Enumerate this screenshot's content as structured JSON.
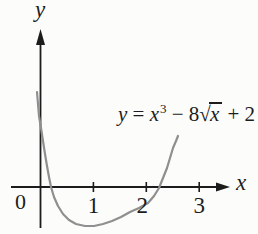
{
  "figure": {
    "background": "#fcfcfb",
    "axis_color": "#1c1c1c",
    "curve_color": "#8f8f8f"
  },
  "labels": {
    "x_axis": "x",
    "y_axis": "y",
    "origin": "0"
  },
  "equation": {
    "lhs": "y",
    "equals": " = ",
    "base": "x",
    "exponent": "3",
    "minus_coef": " − 8",
    "radical": "√",
    "radicand": "x",
    "tail": " + 2"
  },
  "chart_data": {
    "type": "line",
    "equation_text": "y = x³ − 8√x + 2",
    "xlabel": "x",
    "ylabel": "y",
    "x_ticks": [
      1,
      2,
      3
    ],
    "x_tick_labels": [
      "1",
      "2",
      "3"
    ],
    "origin_label": "0",
    "x_range_shown": [
      -0.55,
      3.6
    ],
    "grid": false,
    "legend": false,
    "axes_style": "arrowed-school-axes",
    "features_as_drawn": {
      "x_intercepts_approx": [
        0.15,
        2.2
      ],
      "minimum_x_approx": 1.05,
      "curve_enters_steeply_near_y_axis": true
    },
    "curve_points_px": [
      [
        37,
        92
      ],
      [
        38,
        104
      ],
      [
        39,
        116
      ],
      [
        41,
        128
      ],
      [
        43,
        141
      ],
      [
        45,
        154
      ],
      [
        47,
        166
      ],
      [
        49,
        177
      ],
      [
        51,
        187
      ],
      [
        54,
        197
      ],
      [
        58,
        206
      ],
      [
        63,
        214
      ],
      [
        69,
        220
      ],
      [
        76,
        224
      ],
      [
        85,
        226
      ],
      [
        94,
        226
      ],
      [
        103,
        224
      ],
      [
        112,
        221
      ],
      [
        121,
        217
      ],
      [
        130,
        212
      ],
      [
        139,
        208
      ],
      [
        148,
        203
      ],
      [
        154,
        196
      ],
      [
        159,
        188
      ],
      [
        163,
        178
      ],
      [
        167,
        168
      ],
      [
        170,
        158
      ],
      [
        173,
        148
      ],
      [
        176,
        141
      ],
      [
        178,
        136
      ]
    ]
  }
}
